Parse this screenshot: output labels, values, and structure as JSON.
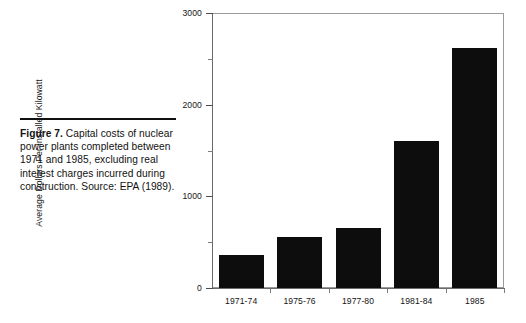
{
  "caption": {
    "label": "Figure 7.",
    "body": " Capital costs of nuclear power plants completed between 1971 and 1985, excluding real interest charges incurred during construction.  Source:  EPA (1989)."
  },
  "chart_data": {
    "type": "bar",
    "title": "",
    "xlabel": "",
    "ylabel": "Average Dollars Per Installed Kilowatt",
    "categories": [
      "1971-74",
      "1975-76",
      "1977-80",
      "1981-84",
      "1985"
    ],
    "values": [
      360,
      557,
      655,
      1607,
      2623
    ],
    "ylim": [
      0,
      3000
    ],
    "ytick_labels": [
      "0",
      "1000",
      "2000",
      "3000"
    ],
    "ytick_values": [
      0,
      1000,
      2000,
      3000
    ],
    "yminor_values": [
      500,
      1500,
      2500
    ],
    "grid": false,
    "legend": false,
    "bar_color": "#0d0d0d"
  }
}
